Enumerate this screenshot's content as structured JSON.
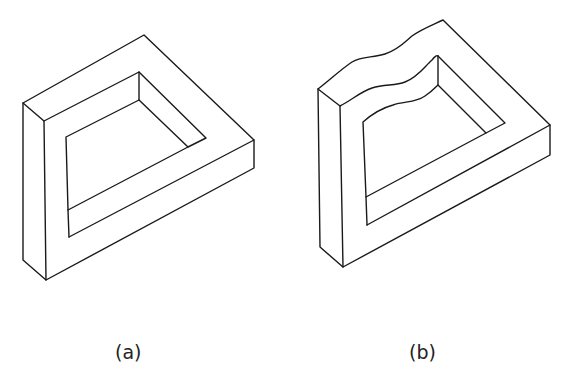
{
  "figure": {
    "panels": [
      {
        "id": "a",
        "label": "(a)",
        "description": "Impossible frame drawn as a closed isometric bracket shape"
      },
      {
        "id": "b",
        "label": "(b)",
        "description": "Same frame with a wavy cut-away top edge"
      }
    ]
  }
}
